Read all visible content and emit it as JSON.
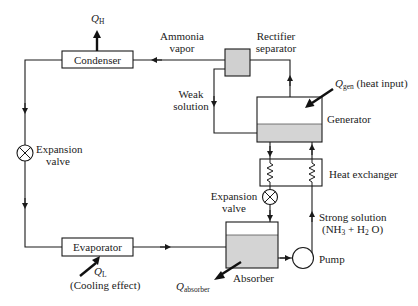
{
  "diagram": {
    "type": "absorption refrigeration cycle schematic",
    "components": {
      "condenser": {
        "label": "Condenser"
      },
      "evaporator": {
        "label": "Evaporator"
      },
      "rectifier": {
        "label_line1": "Rectifier",
        "label_line2": "separator"
      },
      "generator": {
        "label": "Generator"
      },
      "heat_exchanger": {
        "label": "Heat exchanger"
      },
      "absorber": {
        "label": "Absorber"
      },
      "pump": {
        "label": "Pump"
      },
      "expansion_valve_left": {
        "label_line1": "Expansion",
        "label_line2": "valve"
      },
      "expansion_valve_right": {
        "label_line1": "Expansion",
        "label_line2": "valve"
      }
    },
    "streams": {
      "ammonia_vapor": {
        "label_line1": "Ammonia",
        "label_line2": "vapor"
      },
      "weak_solution": {
        "label_line1": "Weak",
        "label_line2": "solution"
      },
      "strong_solution": {
        "label_line1": "Strong solution",
        "formula_nh": "(NH",
        "formula_3": "3",
        "formula_plus_h": " + H",
        "formula_2": "2",
        "formula_o": " O)"
      }
    },
    "heat_flows": {
      "q_h": {
        "symbol": "Q",
        "subscript": "H"
      },
      "q_l": {
        "symbol": "Q",
        "subscript": "L",
        "note": "(Cooling effect)"
      },
      "q_gen": {
        "symbol": "Q",
        "subscript": "gen",
        "note": "(heat input)"
      },
      "q_absorber": {
        "symbol": "Q",
        "subscript": "absorber"
      }
    },
    "colors": {
      "line": "#1a1a1a",
      "box_fill": "#ffffff",
      "liquid_fill": "#d4d4d4",
      "rectifier_fill": "#d0d0d0"
    }
  }
}
